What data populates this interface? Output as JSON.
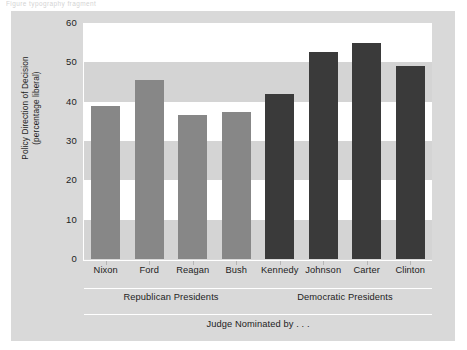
{
  "page_crumb": "Figure typography fragment",
  "chart_data": {
    "type": "bar",
    "title": "",
    "xlabel": "Judge Nominated by . . .",
    "ylabel": "Policy Direction of Decision\n(percentage liberal)",
    "ylabel_line1": "Policy Direction of Decision",
    "ylabel_line2": "(percentage liberal)",
    "ylim": [
      0,
      60
    ],
    "ytick_values": [
      0,
      10,
      20,
      30,
      40,
      50,
      60
    ],
    "ytick_labels": [
      "0",
      "10",
      "20",
      "30",
      "40",
      "50",
      "60"
    ],
    "grid": "alternating horizontal bands",
    "legend": "none",
    "categories": [
      "Nixon",
      "Ford",
      "Reagan",
      "Bush",
      "Kennedy",
      "Johnson",
      "Carter",
      "Clinton"
    ],
    "values": [
      39,
      45.5,
      36.5,
      37.5,
      42,
      52.7,
      54.8,
      49
    ],
    "bar_colors": [
      "#878787",
      "#878787",
      "#878787",
      "#878787",
      "#3a3a3a",
      "#3a3a3a",
      "#3a3a3a",
      "#3a3a3a"
    ],
    "groups": [
      {
        "label": "Republican Presidents",
        "categories": [
          "Nixon",
          "Ford",
          "Reagan",
          "Bush"
        ],
        "color": "#878787"
      },
      {
        "label": "Democratic Presidents",
        "categories": [
          "Kennedy",
          "Johnson",
          "Carter",
          "Clinton"
        ],
        "color": "#3a3a3a"
      }
    ],
    "colors": {
      "card_background": "#d9d9d9",
      "plot_background": "#ffffff",
      "band": "#d4d4d4",
      "republican_bar": "#878787",
      "democratic_bar": "#3a3a3a",
      "axis_line": "#ffffff",
      "text": "#1d1d1d"
    }
  }
}
